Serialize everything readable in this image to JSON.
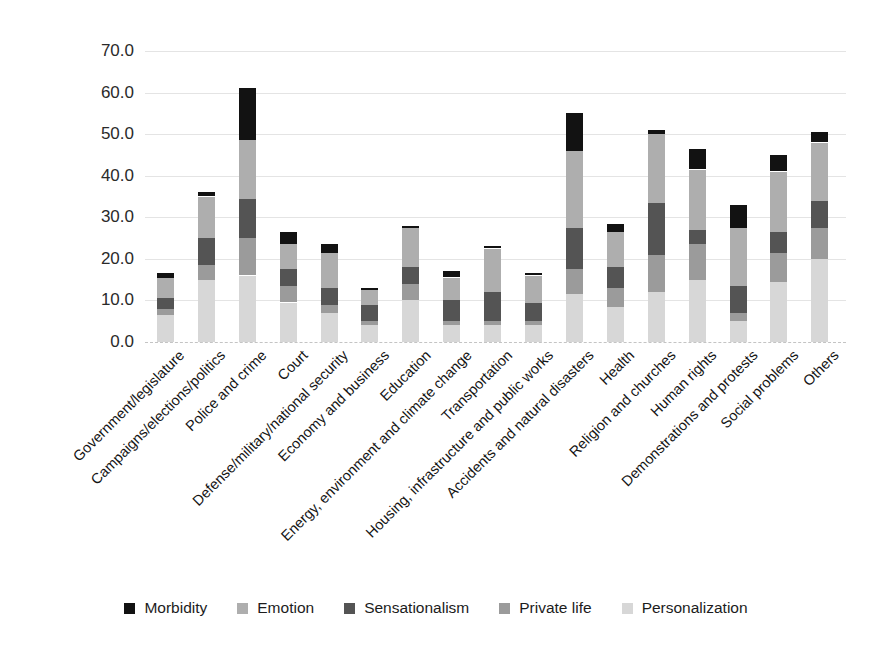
{
  "y_axis": {
    "tick_labels": [
      "70.0",
      "60.0",
      "50.0",
      "40.0",
      "30.0",
      "20.0",
      "10.0",
      "0.0"
    ]
  },
  "legend_items": [
    {
      "label": "Morbidity",
      "color": "#121212"
    },
    {
      "label": "Emotion",
      "color": "#aeaeae"
    },
    {
      "label": "Sensationalism",
      "color": "#545454"
    },
    {
      "label": "Private life",
      "color": "#9b9b9b"
    },
    {
      "label": "Personalization",
      "color": "#d7d7d7"
    }
  ],
  "chart_data": {
    "type": "bar",
    "stacked": true,
    "title": "",
    "xlabel": "",
    "ylabel": "",
    "ylim": [
      0,
      70
    ],
    "ytick_step": 10,
    "grid": true,
    "legend_position": "bottom",
    "categories": [
      "Government/legislature",
      "Campaigns/elections/politics",
      "Police and crime",
      "Court",
      "Defense/military/national security",
      "Economy and business",
      "Education",
      "Energy, environment and climate change",
      "Transportation",
      "Housing, infrastructure and public works",
      "Accidents and natural disasters",
      "Health",
      "Religion and churches",
      "Human rights",
      "Demonstrations and protests",
      "Social problems",
      "Others"
    ],
    "stack_order_bottom_to_top": [
      "Personalization",
      "Private life",
      "Sensationalism",
      "Emotion",
      "Morbidity"
    ],
    "series": [
      {
        "name": "Personalization",
        "color": "#d7d7d7",
        "values": [
          6.5,
          15,
          16,
          9.5,
          7,
          4,
          10,
          4,
          4,
          4,
          11.5,
          8.5,
          12,
          15,
          5,
          14.5,
          20
        ]
      },
      {
        "name": "Private life",
        "color": "#9b9b9b",
        "values": [
          1.5,
          3.5,
          9,
          4,
          2,
          1,
          4,
          1,
          1,
          1,
          6,
          4.5,
          9,
          8.5,
          2,
          7,
          7.5
        ]
      },
      {
        "name": "Sensationalism",
        "color": "#545454",
        "values": [
          2.5,
          6.5,
          9.5,
          4,
          4,
          4,
          4,
          5,
          7,
          4.5,
          10,
          5,
          12.5,
          3.5,
          6.5,
          5,
          6.5
        ]
      },
      {
        "name": "Emotion",
        "color": "#aeaeae",
        "values": [
          5,
          10,
          14,
          6,
          8.5,
          3.5,
          9.5,
          5.5,
          10.5,
          6.5,
          18.5,
          8.5,
          16.5,
          14.5,
          14,
          14.5,
          14
        ]
      },
      {
        "name": "Morbidity",
        "color": "#121212",
        "values": [
          1,
          1,
          12.5,
          3,
          2,
          0.5,
          0.5,
          1.5,
          0.5,
          0.5,
          9,
          2,
          1,
          5,
          5.5,
          4,
          2.5
        ]
      }
    ],
    "totals": [
      16.5,
      36,
      61,
      26.5,
      23.5,
      13,
      28,
      17,
      23,
      16.5,
      55,
      28.5,
      51,
      46.5,
      33,
      45,
      50.5
    ]
  }
}
